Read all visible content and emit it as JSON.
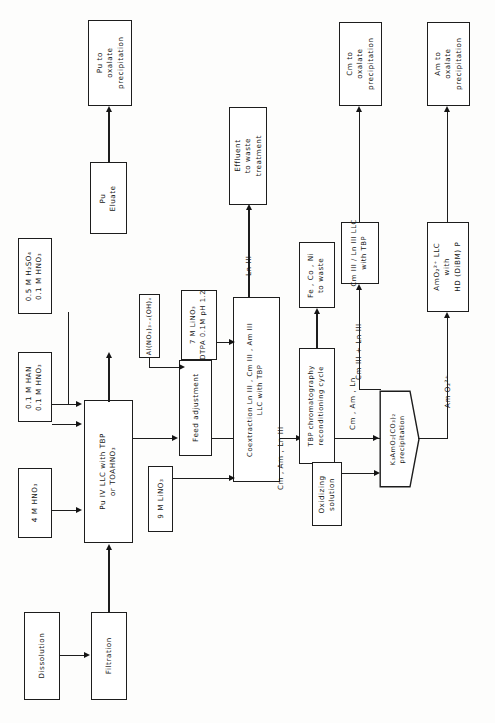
{
  "diagram": {
    "type": "process-flow-diagram",
    "orientation": "landscape-rotated",
    "line_color": "#1d1d1d",
    "background": "#fdfdfc"
  },
  "nodes": {
    "dissolution": {
      "label": "Dissolution"
    },
    "filtration": {
      "label": "Filtration"
    },
    "hno3_feed": {
      "line1": "4 M  HNO₃"
    },
    "han": {
      "line1": "0.1 M  HAN",
      "line2": "0.1 M  HNO₃"
    },
    "h2so4": {
      "line1": "0.5 M  H₂SO₄",
      "line2": "0.1 M  HNO₃"
    },
    "pu_llc": {
      "line1": "Pu IV   LLC with TBP",
      "line2": "or   TOAHNO₃"
    },
    "pu_eluate": {
      "line1": "Pu",
      "line2": "Eluate"
    },
    "pu_oxalate": {
      "line1": "Pu  to",
      "line2": "oxalate",
      "line3": "precipitation"
    },
    "al_nitrate": {
      "line1": "Al(NO₃)₃₋ₓ(OH)ₓ"
    },
    "feed_adjust": {
      "label": "Feed adjustment"
    },
    "linO3_9m": {
      "line1": "9 M  LiNO₃"
    },
    "linO3_7m": {
      "line1": "7 M  LiNO₃",
      "line2": "DTPA 0.1M  pH 1.2"
    },
    "coextraction": {
      "line1": "Coextraction  Ln III ,  Cm III ,  Am III",
      "line2": "LLC  with  TBP"
    },
    "effluent": {
      "line1": "Effluent",
      "line2": "to  waste",
      "line3": "treatment"
    },
    "fe_co_ni": {
      "line1": "Fe , Co , Ni",
      "line2": "to  waste"
    },
    "tbp_chrom": {
      "line1": "TBP chromatography",
      "line2": "reconditioning cycle"
    },
    "oxidizing": {
      "line1": "Oxidizing",
      "line2": "solution"
    },
    "k3amo2": {
      "line1": "K₃AmO₂(CO₃)₂",
      "line2": "precipitation"
    },
    "cm_ln_llc": {
      "line1": "Cm III / Ln III  LLC",
      "line2": "with  TBP"
    },
    "cm_oxalate": {
      "line1": "Cm  to",
      "line2": "oxalate",
      "line3": "precipitation"
    },
    "amo2_llc": {
      "line1": "AmO₂²⁺  LLC",
      "line2": "with",
      "line3": "HD (DiBM) P"
    },
    "am_oxalate": {
      "line1": "Am to",
      "line2": "oxalate",
      "line3": "precipitation"
    }
  },
  "stream_labels": {
    "ln_iii": "Ln III",
    "cm_am_lniii": "Cm , Am , Ln III",
    "cm_am_ln": "Cm , Am ,   Ln",
    "cm_plus_ln": "Cm III + Ln III",
    "amo2": "Am O₂²⁺"
  }
}
